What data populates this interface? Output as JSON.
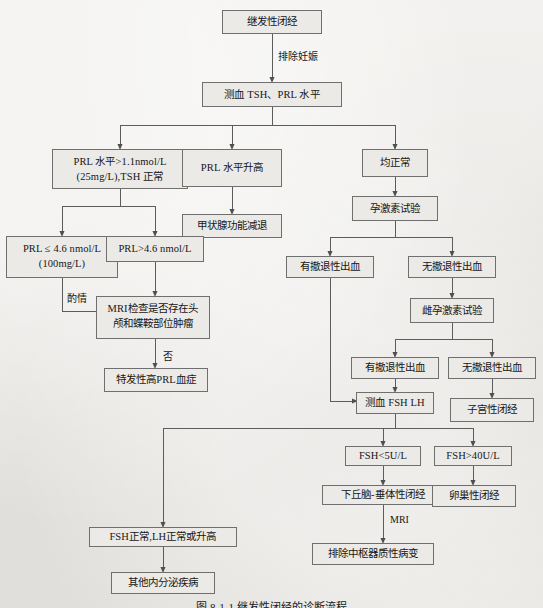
{
  "figure": {
    "caption": "图 8-1-1  继发性闭经的诊断流程",
    "background_color": "#e9e7e3",
    "box_fill_color": "#eceae6",
    "box_border_color": "#6f6f6f",
    "line_color": "#5c5c5c"
  },
  "nodes": {
    "start": {
      "label": "继发性闭经"
    },
    "blood_test": {
      "label": "测血 TSH、PRL 水平"
    },
    "prl_high_tsh_normal_l1": {
      "label": "PRL 水平>1.1nmol/L"
    },
    "prl_high_tsh_normal_l2": {
      "label": "(25mg/L),TSH 正常"
    },
    "prl_elevated": {
      "label": "PRL 水平升高"
    },
    "all_normal": {
      "label": "均正常"
    },
    "hypothyroidism": {
      "label": "甲状腺功能减退"
    },
    "prl_le_l1": {
      "label": "PRL ≤ 4.6 nmol/L"
    },
    "prl_le_l2": {
      "label": "(100mg/L)"
    },
    "prl_gt": {
      "label": "PRL>4.6 nmol/L"
    },
    "mri_check_l1": {
      "label": "MRI检查是否存在头"
    },
    "mri_check_l2": {
      "label": "颅和蝶鞍部位肿瘤"
    },
    "idiopathic_prl": {
      "label": "特发性高PRL血症"
    },
    "progesterone_test": {
      "label": "孕激素试验"
    },
    "withdrawal_bleed_yes_1": {
      "label": "有撤退性出血"
    },
    "withdrawal_bleed_no_1": {
      "label": "无撤退性出血"
    },
    "estrogen_progesterone_test": {
      "label": "雌孕激素试验"
    },
    "withdrawal_bleed_yes_2": {
      "label": "有撤退性出血"
    },
    "withdrawal_bleed_no_2": {
      "label": "无撤退性出血"
    },
    "uterine_amenorrhea": {
      "label": "子宫性闭经"
    },
    "measure_fsh_lh": {
      "label": "测血 FSH  LH"
    },
    "fsh_low": {
      "label": "FSH<5U/L"
    },
    "fsh_high": {
      "label": "FSH>40U/L"
    },
    "hypothalamic_pituitary": {
      "label": "下丘脑-垂体性闭经"
    },
    "ovarian_amenorrhea": {
      "label": "卵巢性闭经"
    },
    "exclude_central_lesion": {
      "label": "排除中枢器质性病变"
    },
    "fsh_normal_lh": {
      "label": "FSH正常,LH正常或升高"
    },
    "other_endocrine": {
      "label": "其他内分泌疾病"
    }
  },
  "edge_labels": {
    "exclude_pregnancy": "排除妊娠",
    "as_appropriate": "酌情",
    "no": "否",
    "mri": "MRI"
  }
}
